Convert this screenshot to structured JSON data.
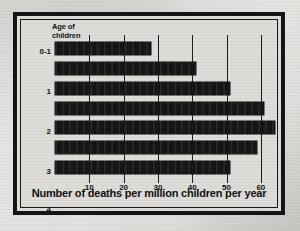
{
  "figure": {
    "y_axis_header_line1": "Age of",
    "y_axis_header_line2": "children",
    "x_axis_title": "Number of deaths per million children per year",
    "ink_color": "#141414",
    "paper_color": "#dddcd8"
  },
  "chart_data": {
    "type": "bar",
    "orientation": "horizontal",
    "title": "",
    "xlabel": "Number of deaths per million children per year",
    "ylabel": "Age of children",
    "categories": [
      "0-1",
      "1",
      "2",
      "3",
      "4",
      "5",
      "6"
    ],
    "values": [
      28,
      41,
      51,
      61,
      64,
      59,
      51
    ],
    "xlim": [
      0,
      65
    ],
    "xticks": [
      10,
      20,
      30,
      40,
      50,
      60
    ],
    "xtick_labels": [
      "10",
      "20",
      "30",
      "40",
      "50",
      "60"
    ],
    "grid": true,
    "grid_axis": "x",
    "legend": false
  }
}
